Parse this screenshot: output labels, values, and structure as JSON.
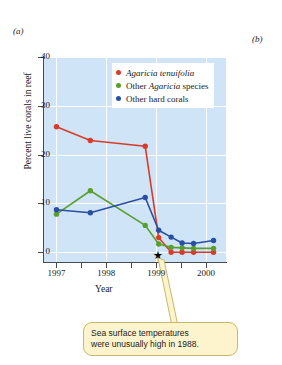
{
  "figure": {
    "panel_a_label": "(a)",
    "panel_b_label": "(b)"
  },
  "annotation": {
    "star_glyph": "★",
    "callout_line1": "Sea surface temperatures",
    "callout_line2": "were unusually high in 1988.",
    "callout_bg": "#fdf4cd",
    "callout_border": "#c8b86a"
  },
  "chart_data": {
    "type": "line",
    "title": "",
    "xlabel": "Year",
    "ylabel": "Percent live corals in reef",
    "xlim": [
      1996.75,
      2000.4
    ],
    "ylim": [
      -2,
      40
    ],
    "yticks": [
      0,
      10,
      20,
      30,
      40
    ],
    "ytick_labels": [
      "0",
      "10",
      "20",
      "30",
      "40"
    ],
    "xticks": [
      1997,
      1998,
      1999,
      2000
    ],
    "xtick_labels": [
      "1997",
      "1998",
      "1999",
      "2000"
    ],
    "grid": true,
    "grid_color": "#ffffff",
    "plot_bg": "#cfe4f7",
    "legend_position": "upper-center",
    "series": [
      {
        "name": "Agaricia tenuifolia",
        "name_italic": "Agaricia tenuifolia",
        "name_roman": "",
        "color": "#d93b2b",
        "x": [
          1997.0,
          1997.68,
          1998.78,
          1999.05,
          1999.3,
          1999.52,
          1999.75,
          2000.15
        ],
        "values": [
          25.7,
          22.9,
          21.7,
          3.0,
          0.0,
          0.0,
          0.0,
          0.0
        ]
      },
      {
        "name": "Other Agaricia species",
        "name_italic": "Agaricia",
        "name_roman_before": "Other ",
        "name_roman_after": " species",
        "color": "#5a9e2f",
        "x": [
          1997.0,
          1997.68,
          1998.78,
          1999.05,
          1999.3,
          1999.52,
          1999.75,
          2000.15
        ],
        "values": [
          7.8,
          12.6,
          5.5,
          1.7,
          1.0,
          0.9,
          0.8,
          0.8
        ]
      },
      {
        "name": "Other hard corals",
        "name_italic": "",
        "name_roman": "Other hard corals",
        "color": "#2a4fa2",
        "x": [
          1997.0,
          1997.68,
          1998.78,
          1999.05,
          1999.3,
          1999.52,
          1999.75,
          2000.15
        ],
        "values": [
          8.7,
          8.1,
          11.2,
          4.5,
          3.1,
          1.9,
          1.8,
          2.4
        ]
      }
    ],
    "legend_entries": [
      {
        "label": "Agaricia tenuifolia",
        "color": "#d93b2b"
      },
      {
        "label": "Other Agaricia species",
        "color": "#5a9e2f"
      },
      {
        "label": "Other hard corals",
        "color": "#2a4fa2"
      }
    ]
  }
}
